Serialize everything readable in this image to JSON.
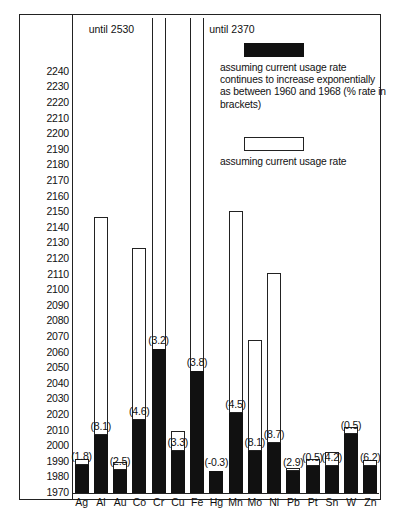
{
  "chart_data": {
    "type": "bar",
    "title": "",
    "xlabel": "",
    "ylabel": "",
    "ylim": [
      1970,
      2245
    ],
    "ytick_step": 10,
    "grid": false,
    "legend_position": "top-right",
    "yticks": [
      2240,
      2230,
      2220,
      2210,
      2200,
      2190,
      2180,
      2170,
      2160,
      2150,
      2140,
      2130,
      2120,
      2110,
      2100,
      2090,
      2080,
      2070,
      2060,
      2050,
      2040,
      2030,
      2020,
      2010,
      2000,
      1990,
      1980,
      1970
    ],
    "categories": [
      "Ag",
      "Al",
      "Au",
      "Co",
      "Cr",
      "Cu",
      "Fe",
      "Hg",
      "Mn",
      "Mo",
      "Ni",
      "Pb",
      "Pt",
      "Sn",
      "W",
      "Zn"
    ],
    "series": [
      {
        "name": "assuming current usage rate continues to increase exponentially as between 1960 and 1968 (% rate in brackets)",
        "style": "solid-black",
        "values": [
          1988,
          2007,
          1985,
          2017,
          2062,
          1997,
          2048,
          1984,
          2021,
          1997,
          2002,
          1984,
          1987,
          1987,
          2008,
          1987
        ]
      },
      {
        "name": "assuming current usage rate",
        "style": "hollow-white",
        "values": [
          1992,
          2147,
          1990,
          2127,
          2530,
          2010,
          2370,
          1984,
          2151,
          2068,
          2111,
          1986,
          1992,
          1996,
          2012,
          1991
        ]
      }
    ],
    "rate_labels": [
      "(1.8)",
      "(8.1)",
      "(2.5)",
      "(4.6)",
      "(3.2)",
      "(3.3)",
      "(3.8)",
      "(-0.3)",
      "(4.5)",
      "(8.1)",
      "(8.7)",
      "(2.9)",
      "(0.5)",
      "(4.2)",
      "(0.5)",
      "(6.2)"
    ],
    "offscale_notes": [
      {
        "category": "Cr",
        "text": "until 2530"
      },
      {
        "category": "Fe",
        "text": "until 2370"
      }
    ]
  },
  "legend": {
    "entry1_swatch": "solid-black-swatch",
    "entry1_text": "assuming current usage rate continues to increase exponentially as between 1960 and 1968 (% rate in brackets)",
    "entry2_swatch": "hollow-white-swatch",
    "entry2_text": "assuming current usage rate"
  },
  "annotations": {
    "until_cr": "until 2530",
    "until_fe": "until 2370"
  }
}
